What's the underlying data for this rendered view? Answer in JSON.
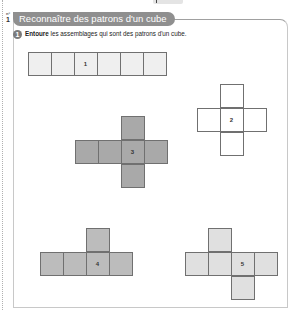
{
  "header": {
    "exercise_marker_prefix": "n°",
    "exercise_marker_number": "1",
    "section_title": "Reconnaître des patrons d'un cube"
  },
  "question": {
    "number": "1",
    "instruction_bold": "Entoure",
    "instruction_rest": " les assemblages qui sont des patrons d'un cube."
  },
  "nets": [
    {
      "label": "1",
      "fill": "#efefef",
      "shape": "row of 6 squares"
    },
    {
      "label": "2",
      "fill": "#ffffff",
      "shape": "cross (column of 3, row of 3)"
    },
    {
      "label": "3",
      "fill": "#a9a9a9",
      "shape": "row of 4 with one square above and below the third"
    },
    {
      "label": "4",
      "fill": "#bcbcbc",
      "shape": "row of 4 with one square above the third"
    },
    {
      "label": "5",
      "fill": "#e0e0e0",
      "shape": "row of 4 with one square above the second and one below the third"
    }
  ],
  "colors": {
    "title_pill": "#8f8f8f",
    "cell_border": "#707070"
  }
}
